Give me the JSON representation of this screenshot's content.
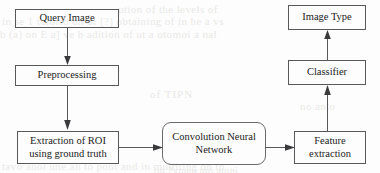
{
  "diagram": {
    "stroke_color": "#58585a",
    "text_color": "#1b1b1b",
    "background_color": "#fdfdfd",
    "nodes": [
      {
        "id": "query_image",
        "label": "Query Image",
        "shape": "rectangle"
      },
      {
        "id": "preprocessing",
        "label": "Preprocessing",
        "shape": "rectangle"
      },
      {
        "id": "roi",
        "line1": "Extraction of ROI",
        "line2": "using ground truth",
        "shape": "rectangle"
      },
      {
        "id": "cnn",
        "line1": "Convolution Neural",
        "line2": "Network",
        "shape": "rounded-rectangle"
      },
      {
        "id": "feature",
        "line1": "Feature",
        "line2": "extraction",
        "shape": "rectangle"
      },
      {
        "id": "classifier",
        "label": "Classifier",
        "shape": "rectangle"
      },
      {
        "id": "image_type",
        "label": "Image Type",
        "shape": "rectangle"
      }
    ],
    "edges": [
      {
        "from": "query_image",
        "to": "preprocessing",
        "direction": "down"
      },
      {
        "from": "preprocessing",
        "to": "roi",
        "direction": "down"
      },
      {
        "from": "roi",
        "to": "cnn",
        "direction": "right"
      },
      {
        "from": "cnn",
        "to": "feature",
        "direction": "right"
      },
      {
        "from": "feature",
        "to": "classifier",
        "direction": "up"
      },
      {
        "from": "classifier",
        "to": "image_type",
        "direction": "up"
      }
    ]
  },
  "artifacts": {
    "bleed_1": "ution of the levels of",
    "bleed_2": "in se  1 tutorio  on of [?] obtaining of in he a vs",
    "bleed_3": "b  (a) on  E  a]  ve  b adition of  ut a utomoi  a nal",
    "bleed_4": "of     TIPN",
    "bleed_5": "tavo anol  une  an  to  pont and in   multiting on to",
    "bleed_6": "on 2vmen  mo  atoni",
    "bleed_7": "no anto"
  }
}
